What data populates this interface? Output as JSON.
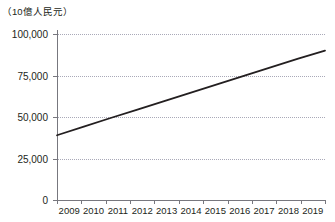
{
  "chart_data": {
    "type": "line",
    "title": "",
    "subtitle": "",
    "unit_label": "（10億人民元）",
    "xlabel": "",
    "ylabel": "",
    "categories": [
      "2009",
      "2010",
      "2011",
      "2012",
      "2013",
      "2014",
      "2015",
      "2016",
      "2017",
      "2018",
      "2019"
    ],
    "series": [
      {
        "name": "",
        "values": [
          39000,
          44200,
          49400,
          54500,
          59600,
          64700,
          69800,
          74900,
          80000,
          85100,
          90000
        ]
      }
    ],
    "ylim": [
      0,
      100000
    ],
    "yticks": [
      0,
      25000,
      50000,
      75000,
      100000
    ],
    "ytick_labels": [
      "0",
      "25,000",
      "50,000",
      "75,000",
      "100,000"
    ],
    "grid": "horizontal-dotted",
    "legend": "none",
    "line_color": "#231f20",
    "grid_color": "#a9a9b8",
    "axis_color": "#77777e",
    "background_color": "#ffffff"
  }
}
